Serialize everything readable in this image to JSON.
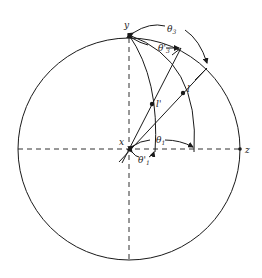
{
  "diagram": {
    "type": "stereographic-projection",
    "axes": {
      "x_label": "x",
      "y_label": "y",
      "z_label": "z"
    },
    "points": [
      {
        "id": "l",
        "label": "l"
      },
      {
        "id": "l_prime",
        "label": "l'"
      }
    ],
    "angles": [
      {
        "id": "theta1",
        "symbol": "θ",
        "subscript": "1",
        "description": "angle from x to great circle through l"
      },
      {
        "id": "theta1_prime",
        "symbol": "θ'",
        "subscript": "1",
        "description": "angle from x to great circle through l'"
      },
      {
        "id": "theta3",
        "symbol": "θ",
        "subscript": "3",
        "description": "angle from y to trace of l on primitive"
      },
      {
        "id": "theta3_prime",
        "symbol": "θ'",
        "subscript": "3",
        "description": "angle from y to trace of l' on primitive"
      }
    ],
    "stroke_color": "#1a1a1a",
    "background": "#ffffff"
  }
}
